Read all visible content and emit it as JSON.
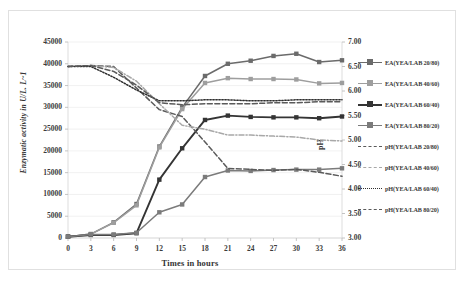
{
  "axes": {
    "y_left_title": "Enzymatic activity  in U/L. L~1",
    "y_right_title": "pH",
    "x_title": "Times in hours",
    "y_left_ticks": [
      "0",
      "5000",
      "10000",
      "15000",
      "20000",
      "25000",
      "30000",
      "35000",
      "40000",
      "45000"
    ],
    "y_right_ticks": [
      "3.00",
      "3.50",
      "4.00",
      "4.50",
      "5.00",
      "5.50",
      "6.00",
      "6.50",
      "7.00"
    ],
    "x_ticks": [
      "0",
      "3",
      "6",
      "9",
      "12",
      "15",
      "18",
      "21",
      "24",
      "27",
      "30",
      "33",
      "36"
    ]
  },
  "legend": {
    "items": [
      {
        "label": "EA(YEA/LAB 20/80)",
        "color": "#6b6b6b",
        "style": "solid",
        "marker": "square",
        "width": "1.6"
      },
      {
        "label": "EA(YEA/LAB 40/60)",
        "color": "#9e9e9e",
        "style": "solid",
        "marker": "square",
        "width": "1.6"
      },
      {
        "label": "EA(YEA/LAB 60/40)",
        "color": "#343434",
        "style": "solid",
        "marker": "square",
        "width": "2.2"
      },
      {
        "label": "EA(YEA/LAB 80/20)",
        "color": "#7b7b7b",
        "style": "solid",
        "marker": "square",
        "width": "1.6"
      },
      {
        "label": "pH(YEA/LAB 20/80)",
        "color": "#5a5a5a",
        "style": "dashed",
        "marker": "none",
        "width": "1.8"
      },
      {
        "label": "pH(YEA/LAB 40/60)",
        "color": "#a8a8a8",
        "style": "dashdot",
        "marker": "none",
        "width": "1.4"
      },
      {
        "label": "pH(YEA/LAB 60/40)",
        "color": "#2f2f2f",
        "style": "dotted",
        "marker": "none",
        "width": "1.8"
      },
      {
        "label": "pH(YEA/LAB 80/20)",
        "color": "#5a5a5a",
        "style": "dashed",
        "marker": "none",
        "width": "1.8"
      }
    ]
  },
  "chart_data": {
    "type": "line",
    "title": "",
    "xlabel": "Times in hours",
    "ylabel": "Enzymatic activity  in U/L. L~1",
    "y2label": "pH",
    "x": [
      0,
      3,
      6,
      9,
      12,
      15,
      18,
      21,
      24,
      27,
      30,
      33,
      36
    ],
    "xlim": [
      0,
      36
    ],
    "ylim": [
      0,
      45000
    ],
    "y2lim": [
      3.0,
      7.0
    ],
    "grid": true,
    "legend_position": "right",
    "series": [
      {
        "name": "EA(YEA/LAB 20/80)",
        "axis": "left",
        "color": "#6b6b6b",
        "style": "solid",
        "marker": "square",
        "values": [
          300,
          900,
          3600,
          7800,
          21000,
          30000,
          37200,
          40000,
          40700,
          41800,
          42300,
          40400,
          40800
        ]
      },
      {
        "name": "EA(YEA/LAB 40/60)",
        "axis": "left",
        "color": "#9e9e9e",
        "style": "solid",
        "marker": "square",
        "values": [
          300,
          900,
          3500,
          7500,
          20800,
          29600,
          35600,
          36700,
          36500,
          36500,
          36400,
          35500,
          35600
        ]
      },
      {
        "name": "EA(YEA/LAB 60/40)",
        "axis": "left",
        "color": "#343434",
        "style": "solid",
        "marker": "square",
        "values": [
          300,
          700,
          700,
          1100,
          13400,
          20600,
          27100,
          28100,
          27800,
          27700,
          27700,
          27500,
          27900
        ]
      },
      {
        "name": "EA(YEA/LAB 80/20)",
        "axis": "left",
        "color": "#7b7b7b",
        "style": "solid",
        "marker": "square",
        "values": [
          300,
          800,
          800,
          1200,
          5900,
          7700,
          14000,
          15500,
          15400,
          15600,
          15700,
          15700,
          16000
        ]
      },
      {
        "name": "pH(YEA/LAB 20/80)",
        "axis": "right",
        "color": "#5a5a5a",
        "style": "dashed",
        "marker": "none",
        "values": [
          6.5,
          6.52,
          6.5,
          6.06,
          5.62,
          5.48,
          4.96,
          4.42,
          4.4,
          4.38,
          4.4,
          4.34,
          4.26
        ]
      },
      {
        "name": "pH(YEA/LAB 40/60)",
        "axis": "right",
        "color": "#a8a8a8",
        "style": "dashdot",
        "marker": "none",
        "values": [
          6.5,
          6.52,
          6.48,
          6.2,
          5.74,
          5.3,
          5.22,
          5.1,
          5.1,
          5.08,
          5.06,
          5.0,
          4.98
        ]
      },
      {
        "name": "pH(YEA/LAB 60/40)",
        "axis": "right",
        "color": "#2f2f2f",
        "style": "dotted",
        "marker": "none",
        "values": [
          6.5,
          6.5,
          6.28,
          6.02,
          5.8,
          5.8,
          5.82,
          5.82,
          5.8,
          5.8,
          5.82,
          5.82,
          5.82
        ]
      },
      {
        "name": "pH(YEA/LAB 80/20)",
        "axis": "right",
        "color": "#5a5a5a",
        "style": "dashed",
        "marker": "none",
        "values": [
          6.5,
          6.52,
          6.4,
          6.12,
          5.76,
          5.72,
          5.74,
          5.74,
          5.74,
          5.76,
          5.76,
          5.78,
          5.78
        ]
      }
    ]
  }
}
